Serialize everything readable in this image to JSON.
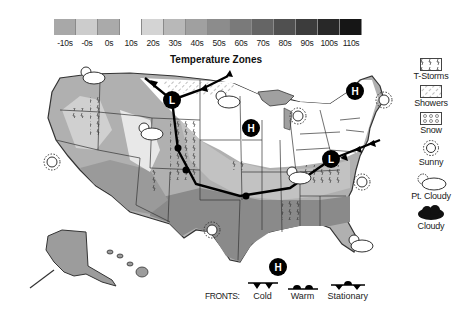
{
  "scale": {
    "title": "Temperature Zones",
    "bins": [
      {
        "label": "-10s",
        "color": "#a8a8a8"
      },
      {
        "label": "-0s",
        "color": "#cccccc"
      },
      {
        "label": "0s",
        "color": "#aaaaaa"
      },
      {
        "label": "10s",
        "color": "#ffffff"
      },
      {
        "label": "20s",
        "color": "#d4d4d4"
      },
      {
        "label": "30s",
        "color": "#b8b8b8"
      },
      {
        "label": "40s",
        "color": "#a0a0a0"
      },
      {
        "label": "50s",
        "color": "#8c8c8c"
      },
      {
        "label": "60s",
        "color": "#7a7a7a"
      },
      {
        "label": "70s",
        "color": "#656565"
      },
      {
        "label": "80s",
        "color": "#505050"
      },
      {
        "label": "90s",
        "color": "#3c3c3c"
      },
      {
        "label": "100s",
        "color": "#282828"
      },
      {
        "label": "110s",
        "color": "#161616"
      }
    ]
  },
  "legend": {
    "items": [
      {
        "key": "t-storms",
        "label": "T-Storms"
      },
      {
        "key": "showers",
        "label": "Showers"
      },
      {
        "key": "snow",
        "label": "Snow"
      },
      {
        "key": "sunny",
        "label": "Sunny"
      },
      {
        "key": "pt-cloudy",
        "label": "Pt. Cloudy"
      },
      {
        "key": "cloudy",
        "label": "Cloudy"
      }
    ]
  },
  "fronts": {
    "title": "FRONTS:",
    "items": [
      {
        "key": "cold",
        "label": "Cold"
      },
      {
        "key": "warm",
        "label": "Warm"
      },
      {
        "key": "stationary",
        "label": "Stationary"
      }
    ]
  },
  "pressure_centers": [
    {
      "type": "L",
      "label": "L",
      "region": "northern plains"
    },
    {
      "type": "H",
      "label": "H",
      "region": "upper midwest"
    },
    {
      "type": "H",
      "label": "H",
      "region": "new england"
    },
    {
      "type": "L",
      "label": "L",
      "region": "mid-atlantic"
    },
    {
      "type": "H",
      "label": "H",
      "region": "gulf of mexico"
    }
  ]
}
